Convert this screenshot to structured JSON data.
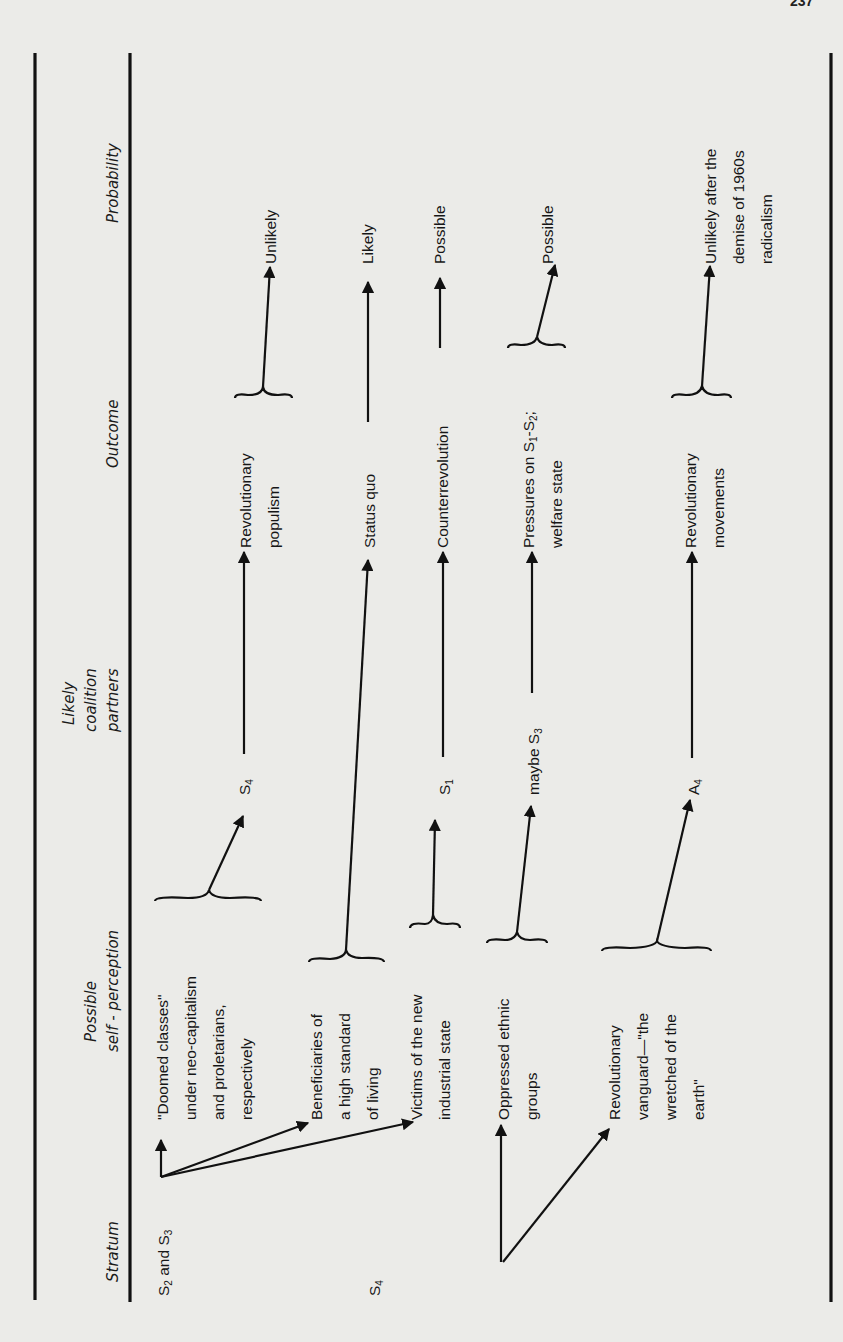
{
  "page": {
    "page_number": "237",
    "orientation": "rotated-90-counterclockwise"
  },
  "headers": {
    "stratum": "Stratum",
    "self_perception_line1": "Possible",
    "self_perception_line2": "self - perception",
    "coalition_line1": "Likely",
    "coalition_line2": "coalition",
    "coalition_line3": "partners",
    "outcome": "Outcome",
    "probability": "Probability"
  },
  "strata": [
    {
      "label_main": "S",
      "sub1": "2",
      "mid": " and S",
      "sub2": "3"
    },
    {
      "label_main": "S",
      "sub1": "4"
    }
  ],
  "self_perceptions": [
    {
      "lines": [
        "\"Doomed classes\"",
        "under neo-capitalism",
        "and proletarians,",
        "respectively"
      ]
    },
    {
      "lines": [
        "Beneficiaries of",
        "a high standard",
        "of living"
      ]
    },
    {
      "lines": [
        "Victims of the new",
        "industrial state"
      ]
    },
    {
      "lines": [
        "Oppressed ethnic",
        "groups"
      ]
    },
    {
      "lines": [
        "Revolutionary",
        "vanguard—\"the",
        "wretched of the",
        "earth\""
      ]
    }
  ],
  "coalition_partners": [
    {
      "main": "S",
      "sub": "4"
    },
    {
      "main": "S",
      "sub": "1"
    },
    {
      "prefix": "maybe S",
      "sub": "3"
    },
    {
      "main": "A",
      "sub": "4"
    }
  ],
  "outcomes": [
    {
      "lines": [
        "Revolutionary",
        "populism"
      ]
    },
    {
      "lines": [
        "Status quo"
      ]
    },
    {
      "lines": [
        "Counterrevolution"
      ]
    },
    {
      "line1_prefix": "Pressures on S",
      "sub1": "1",
      "mid": "-S",
      "sub2": "2",
      "suffix": ";",
      "line2": "welfare state"
    },
    {
      "lines": [
        "Revolutionary",
        "movements"
      ]
    }
  ],
  "probabilities": [
    {
      "lines": [
        "Unlikely"
      ]
    },
    {
      "lines": [
        "Likely"
      ]
    },
    {
      "lines": [
        "Possible"
      ]
    },
    {
      "lines": [
        "Possible"
      ]
    },
    {
      "lines": [
        "Unlikely after the",
        "demise of  1960s",
        "radicalism"
      ]
    }
  ],
  "flows": [
    {
      "from": "S2 and S3",
      "via": "Doomed classes / proletarians",
      "partner": "S4",
      "outcome": "Revolutionary populism",
      "probability": "Unlikely"
    },
    {
      "from": "S2 and S3",
      "via": "Beneficiaries of a high standard of living",
      "partner": null,
      "outcome": "Status quo",
      "probability": "Likely"
    },
    {
      "from": "S2 and S3",
      "via": "Victims of the new industrial state",
      "partner": "S1",
      "outcome": "Counterrevolution",
      "probability": "Possible"
    },
    {
      "from": "S4",
      "via": "Oppressed ethnic groups",
      "partner": "maybe S3",
      "outcome": "Pressures on S1-S2; welfare state",
      "probability": "Possible"
    },
    {
      "from": "S4",
      "via": "Revolutionary vanguard—the wretched of the earth",
      "partner": "A4",
      "outcome": "Revolutionary movements",
      "probability": "Unlikely after the demise of 1960s radicalism"
    }
  ]
}
